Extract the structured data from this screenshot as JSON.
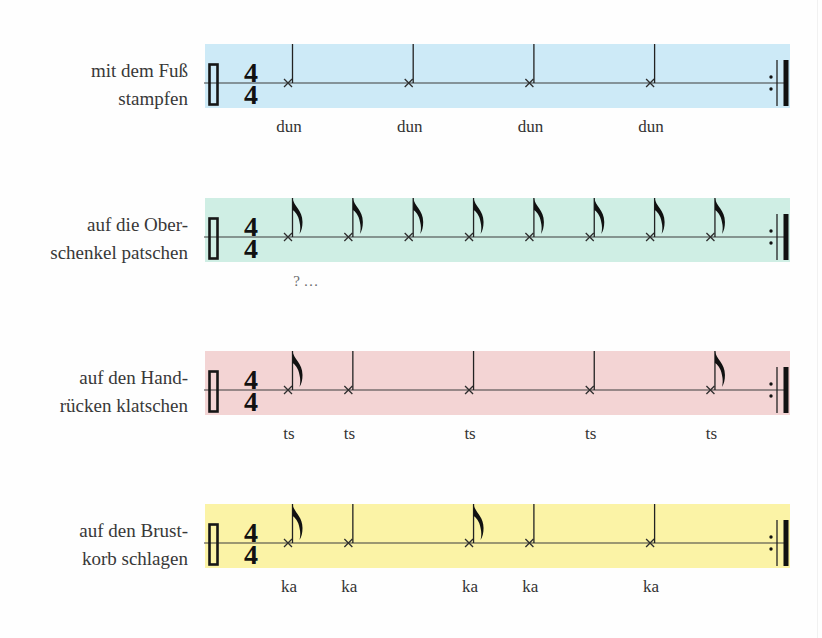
{
  "time_signature": {
    "numerator": "4",
    "denominator": "4"
  },
  "rows": [
    {
      "label_lines": [
        "mit dem Fuß",
        "stampfen"
      ],
      "color": "#cdeaf7",
      "notes": [
        {
          "beat": 0,
          "type": "quarter"
        },
        {
          "beat": 1,
          "type": "quarter"
        },
        {
          "beat": 2,
          "type": "quarter"
        },
        {
          "beat": 3,
          "type": "quarter"
        }
      ],
      "syllables": [
        {
          "text": "dun",
          "beat": 0
        },
        {
          "text": "dun",
          "beat": 1
        },
        {
          "text": "dun",
          "beat": 2
        },
        {
          "text": "dun",
          "beat": 3
        }
      ]
    },
    {
      "label_lines": [
        "auf die Ober-",
        "schenkel patschen"
      ],
      "color": "#cfeee4",
      "notes": [
        {
          "beat": 0,
          "type": "eighth"
        },
        {
          "beat": 0.5,
          "type": "eighth"
        },
        {
          "beat": 1,
          "type": "eighth"
        },
        {
          "beat": 1.5,
          "type": "eighth"
        },
        {
          "beat": 2,
          "type": "eighth"
        },
        {
          "beat": 2.5,
          "type": "eighth"
        },
        {
          "beat": 3,
          "type": "eighth"
        },
        {
          "beat": 3.5,
          "type": "eighth"
        }
      ],
      "syllables": [
        {
          "text": "? …",
          "beat": 0.14,
          "muted": true
        }
      ]
    },
    {
      "label_lines": [
        "auf den Hand-",
        "rücken klatschen"
      ],
      "color": "#f3d4d4",
      "notes": [
        {
          "beat": 0,
          "type": "eighth"
        },
        {
          "beat": 0.5,
          "type": "quarter"
        },
        {
          "beat": 1.5,
          "type": "quarter"
        },
        {
          "beat": 2.5,
          "type": "quarter"
        },
        {
          "beat": 3.5,
          "type": "eighth"
        }
      ],
      "syllables": [
        {
          "text": "ts",
          "beat": 0
        },
        {
          "text": "ts",
          "beat": 0.5
        },
        {
          "text": "ts",
          "beat": 1.5
        },
        {
          "text": "ts",
          "beat": 2.5
        },
        {
          "text": "ts",
          "beat": 3.5
        }
      ]
    },
    {
      "label_lines": [
        "auf den Brust-",
        "korb schlagen"
      ],
      "color": "#fbf3a6",
      "notes": [
        {
          "beat": 0,
          "type": "eighth"
        },
        {
          "beat": 0.5,
          "type": "quarter"
        },
        {
          "beat": 1.5,
          "type": "eighth"
        },
        {
          "beat": 2,
          "type": "quarter"
        },
        {
          "beat": 3,
          "type": "quarter"
        }
      ],
      "syllables": [
        {
          "text": "ka",
          "beat": 0
        },
        {
          "text": "ka",
          "beat": 0.5
        },
        {
          "text": "ka",
          "beat": 1.5
        },
        {
          "text": "ka",
          "beat": 2
        },
        {
          "text": "ka",
          "beat": 3
        }
      ]
    }
  ]
}
